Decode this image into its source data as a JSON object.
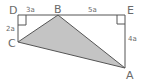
{
  "diagram": {
    "type": "geometry-figure",
    "colors": {
      "stroke": "#555555",
      "fill": "#c4c4c4",
      "label": "#6a6a6a"
    },
    "points": {
      "D": {
        "label": "D",
        "x": 18,
        "y": 15
      },
      "B": {
        "label": "B",
        "x": 58,
        "y": 15
      },
      "E": {
        "label": "E",
        "x": 125,
        "y": 15
      },
      "C": {
        "label": "C",
        "x": 18,
        "y": 42
      },
      "A": {
        "label": "A",
        "x": 125,
        "y": 68
      }
    },
    "segments": {
      "DB": {
        "label": "3a"
      },
      "BE": {
        "label": "5a"
      },
      "DC": {
        "label": "2a"
      },
      "EA": {
        "label": "4a"
      }
    },
    "shaded_triangle": [
      "A",
      "B",
      "C"
    ],
    "right_angles": [
      "D",
      "E"
    ]
  }
}
